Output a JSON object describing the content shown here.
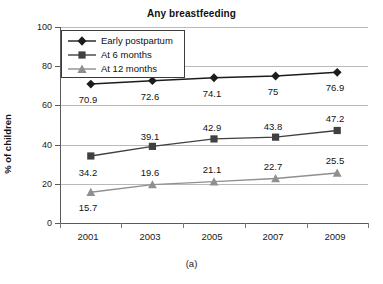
{
  "chart_data": {
    "type": "line",
    "title": "Any breastfeeding",
    "xlabel": "",
    "ylabel": "% of children",
    "categories": [
      "2001",
      "2003",
      "2005",
      "2007",
      "2009"
    ],
    "x": [
      2001,
      2003,
      2005,
      2007,
      2009
    ],
    "ylim": [
      0,
      100
    ],
    "yticks": [
      "0",
      "20",
      "40",
      "60",
      "80",
      "100"
    ],
    "grid": true,
    "legend_position": "top-left",
    "caption": "(a)",
    "series": [
      {
        "name": "Early postpartum",
        "marker": "diamond",
        "color": "#1c1c1c",
        "values": [
          70.9,
          72.6,
          74.1,
          75,
          76.9
        ],
        "labels": [
          "70.9",
          "72.6",
          "74.1",
          "75",
          "76.9"
        ]
      },
      {
        "name": "At 6 months",
        "marker": "square",
        "color": "#404040",
        "values": [
          34.2,
          39.1,
          42.9,
          43.8,
          47.2
        ],
        "labels": [
          "34.2",
          "39.1",
          "42.9",
          "43.8",
          "47.2"
        ]
      },
      {
        "name": "At 12 months",
        "marker": "triangle",
        "color": "#8f8f8f",
        "values": [
          15.7,
          19.6,
          21.1,
          22.7,
          25.5
        ],
        "labels": [
          "15.7",
          "19.6",
          "21.1",
          "22.7",
          "25.5"
        ]
      }
    ]
  }
}
